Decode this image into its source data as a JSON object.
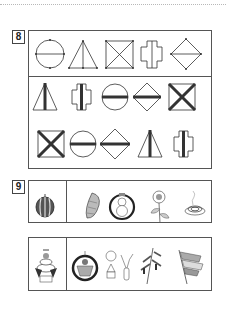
{
  "page": {
    "background": "#ffffff",
    "border_color": "#555555"
  },
  "question8": {
    "number": "8",
    "model_row": {
      "shapes": [
        "circle-with-diameter",
        "triangle-with-median",
        "square-with-diagonals",
        "cross-with-vertical-line",
        "diamond-with-horizontal-line"
      ]
    },
    "answer_grid": {
      "rows": [
        [
          "triangle-bold-median",
          "cross-bold-vertical",
          "circle-bold-diameter",
          "diamond-bold-horizontal",
          "square-bold-diagonals"
        ],
        [
          "square-bold-diagonals",
          "circle-bold-diameter",
          "diamond-bold-horizontal",
          "triangle-bold-median",
          "cross-bold-vertical"
        ]
      ]
    }
  },
  "question9": {
    "number": "9",
    "rows": [
      {
        "prompt_icon": "watermelon-icon",
        "choices": [
          "cicada-icon",
          "snowman-ornament-icon",
          "sunflower-icon",
          "mosquito-coil-icon"
        ]
      },
      {
        "prompt_icon": "kagami-mochi-icon",
        "choices": [
          "basket-ornament-icon",
          "moon-viewing-icon",
          "tanabata-bamboo-icon",
          "koinobori-icon"
        ]
      }
    ]
  }
}
